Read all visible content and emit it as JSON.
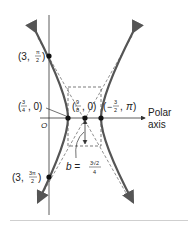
{
  "figure": {
    "type": "hyperbola-polar-graph",
    "axis_label_line1": "Polar",
    "axis_label_line2": "axis",
    "pole_label": "O",
    "points": [
      {
        "id": "top",
        "label_r": "3",
        "label_theta_num": "π",
        "label_theta_den": "2"
      },
      {
        "id": "vertex-left",
        "label_num": "3",
        "label_den": "4",
        "label_theta": "0"
      },
      {
        "id": "center",
        "label_num": "9",
        "label_den": "8",
        "label_theta": "0"
      },
      {
        "id": "vertex-right",
        "label_num": "3",
        "label_den": "2",
        "label_sign": "−",
        "label_theta": "π"
      },
      {
        "id": "bottom",
        "label_r": "3",
        "label_theta_num": "3π",
        "label_theta_den": "2"
      }
    ],
    "b_label": "b =",
    "b_num": "3√2",
    "b_den": "4",
    "colors": {
      "curve": "#555555",
      "line": "#333333",
      "dashed": "#444444",
      "point": "#111111"
    }
  }
}
